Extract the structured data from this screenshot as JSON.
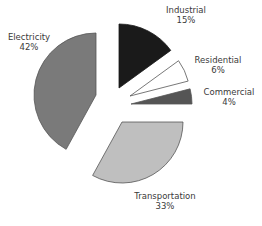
{
  "chart_data": {
    "type": "pie",
    "title": "",
    "exploded": true,
    "start_angle": "12 o'clock, clockwise",
    "categories": [
      "Industrial",
      "Residential",
      "Commercial",
      "Transportation",
      "Electricity"
    ],
    "values": [
      15,
      6,
      4,
      33,
      42
    ],
    "unit": "%",
    "slices": [
      {
        "label": "Industrial",
        "value": 15,
        "value_label": "15%",
        "color": "#1a1a1a",
        "stroke": "#1a1a1a",
        "apex": [
          119,
          88
        ],
        "r": 64,
        "label_pos": [
          186,
          5
        ]
      },
      {
        "label": "Residential",
        "value": 6,
        "value_label": "6%",
        "color": "#ffffff",
        "stroke": "#555555",
        "apex": [
          130,
          96
        ],
        "r": 60,
        "label_pos": [
          218,
          55
        ]
      },
      {
        "label": "Commercial",
        "value": 4,
        "value_label": "4%",
        "color": "#555555",
        "stroke": "#555555",
        "apex": [
          131,
          104
        ],
        "r": 61,
        "label_pos": [
          229,
          87
        ]
      },
      {
        "label": "Transportation",
        "value": 33,
        "value_label": "33%",
        "color": "#bfbfbf",
        "stroke": "#555555",
        "apex": [
          122,
          122
        ],
        "r": 61,
        "label_pos": [
          165,
          191
        ]
      },
      {
        "label": "Electricity",
        "value": 42,
        "value_label": "42%",
        "color": "#7a7a7a",
        "stroke": "#555555",
        "apex": [
          96,
          95
        ],
        "r": 62,
        "label_pos": [
          29,
          32
        ]
      }
    ],
    "legend": "none (inline labels)"
  }
}
